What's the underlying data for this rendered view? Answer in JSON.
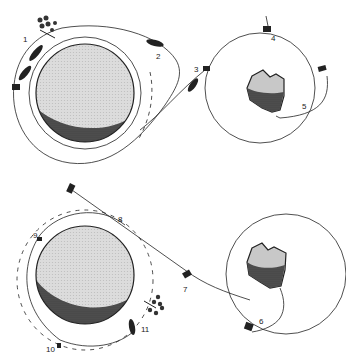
{
  "diagram": {
    "type": "mission-sequence",
    "panels": [
      {
        "id": "outbound",
        "bodies": [
          "planet",
          "asteroid"
        ],
        "stages": [
          {
            "number": "1",
            "label": "1"
          },
          {
            "number": "2",
            "label": "2"
          },
          {
            "number": "3",
            "label": "3"
          },
          {
            "number": "4",
            "label": "4"
          },
          {
            "number": "5",
            "label": "5"
          }
        ]
      },
      {
        "id": "return",
        "bodies": [
          "planet",
          "asteroid"
        ],
        "stages": [
          {
            "number": "6",
            "label": "6"
          },
          {
            "number": "7",
            "label": "7"
          },
          {
            "number": "8",
            "label": "8"
          },
          {
            "number": "9",
            "label": "9"
          },
          {
            "number": "10",
            "label": "10"
          },
          {
            "number": "11",
            "label": "11"
          }
        ]
      }
    ],
    "colors": {
      "line": "#222222",
      "planet_light": "#d8d8d8",
      "planet_dark": "#4a4a4a",
      "asteroid_light": "#c8c8c8",
      "asteroid_dark": "#5a5a5a"
    }
  }
}
